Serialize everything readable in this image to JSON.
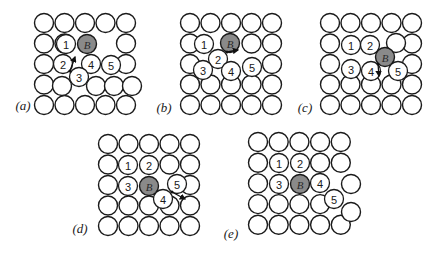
{
  "figure": {
    "colors": {
      "atom_fill": "#ffffff",
      "atom_stroke": "#1a1a1a",
      "impurity_fill": "#8a8a8a"
    },
    "radius": 9.5,
    "panels": [
      {
        "label": "(a)",
        "label_pos": [
          23,
          105
        ],
        "origin": [
          44,
          23
        ],
        "pitch": 20.5,
        "skip": [
          [
            1,
            2
          ],
          [
            1,
            3
          ],
          [
            2,
            1
          ],
          [
            2,
            2
          ],
          [
            2,
            3
          ],
          [
            3,
            1
          ],
          [
            3,
            2
          ]
        ],
        "extra_plain": [
          [
            62,
            86
          ],
          [
            96,
            86
          ],
          [
            114,
            86
          ],
          [
            132,
            86
          ]
        ],
        "special": [
          {
            "n": "1",
            "x": 66,
            "y": 44
          },
          {
            "n": "B",
            "x": 87,
            "y": 44,
            "impurity": true
          },
          {
            "n": "2",
            "x": 63,
            "y": 64
          },
          {
            "n": "4",
            "x": 91,
            "y": 64
          },
          {
            "n": "5",
            "x": 111,
            "y": 65
          },
          {
            "n": "3",
            "x": 79,
            "y": 77
          }
        ],
        "arrow": {
          "x1": 70,
          "y1": 71,
          "x2": 75,
          "y2": 57
        }
      },
      {
        "label": "(b)",
        "label_pos": [
          164,
          107
        ],
        "origin": [
          190,
          23
        ],
        "pitch": 20.5,
        "skip": [
          [
            1,
            1
          ],
          [
            1,
            2
          ],
          [
            2,
            1
          ],
          [
            2,
            2
          ],
          [
            2,
            3
          ]
        ],
        "extra_plain": [],
        "special": [
          {
            "n": "1",
            "x": 204,
            "y": 44
          },
          {
            "n": "B",
            "x": 230,
            "y": 43,
            "impurity": true
          },
          {
            "n": "2",
            "x": 218,
            "y": 59
          },
          {
            "n": "3",
            "x": 203,
            "y": 70
          },
          {
            "n": "4",
            "x": 231,
            "y": 71
          },
          {
            "n": "5",
            "x": 252,
            "y": 67
          }
        ],
        "arrow": {
          "x1": 227,
          "y1": 52,
          "x2": 238,
          "y2": 50
        }
      },
      {
        "label": "(c)",
        "label_pos": [
          305,
          107
        ],
        "origin": [
          330,
          23
        ],
        "pitch": 20.5,
        "skip": [
          [
            1,
            1
          ],
          [
            1,
            2
          ],
          [
            1,
            3
          ],
          [
            2,
            1
          ],
          [
            2,
            2
          ],
          [
            2,
            3
          ]
        ],
        "extra_plain": [
          [
            396,
            43
          ]
        ],
        "special": [
          {
            "n": "1",
            "x": 351,
            "y": 45
          },
          {
            "n": "2",
            "x": 370,
            "y": 45
          },
          {
            "n": "B",
            "x": 385,
            "y": 57,
            "impurity": true
          },
          {
            "n": "3",
            "x": 351,
            "y": 69
          },
          {
            "n": "4",
            "x": 371,
            "y": 71
          },
          {
            "n": "5",
            "x": 398,
            "y": 71
          }
        ],
        "arrow": {
          "x1": 378,
          "y1": 64,
          "x2": 379,
          "y2": 76
        }
      },
      {
        "label": "(d)",
        "label_pos": [
          80,
          228
        ],
        "origin": [
          108,
          144
        ],
        "pitch": 20.5,
        "skip": [
          [
            1,
            1
          ],
          [
            1,
            2
          ],
          [
            2,
            1
          ],
          [
            2,
            2
          ],
          [
            2,
            3
          ]
        ],
        "extra_plain": [],
        "special": [
          {
            "n": "1",
            "x": 128,
            "y": 165
          },
          {
            "n": "2",
            "x": 149,
            "y": 165
          },
          {
            "n": "3",
            "x": 128,
            "y": 186
          },
          {
            "n": "B",
            "x": 149,
            "y": 186,
            "impurity": true
          },
          {
            "n": "4",
            "x": 163,
            "y": 199
          },
          {
            "n": "5",
            "x": 177,
            "y": 184
          }
        ],
        "arrow": {
          "x1": 172,
          "y1": 192,
          "x2": 185,
          "y2": 199
        }
      },
      {
        "label": "(e)",
        "label_pos": [
          231,
          233
        ],
        "origin": [
          258,
          142
        ],
        "pitch": 20.7,
        "skip": [
          [
            1,
            1
          ],
          [
            1,
            2
          ],
          [
            2,
            1
          ],
          [
            2,
            2
          ],
          [
            2,
            3
          ],
          [
            2,
            4
          ],
          [
            3,
            4
          ]
        ],
        "extra_plain": [
          [
            351,
            184
          ],
          [
            351,
            212
          ]
        ],
        "special": [
          {
            "n": "1",
            "x": 279,
            "y": 163
          },
          {
            "n": "2",
            "x": 300,
            "y": 163
          },
          {
            "n": "3",
            "x": 279,
            "y": 184
          },
          {
            "n": "B",
            "x": 300,
            "y": 184,
            "impurity": true
          },
          {
            "n": "4",
            "x": 320,
            "y": 183
          },
          {
            "n": "5",
            "x": 334,
            "y": 199
          }
        ],
        "arrow": null
      }
    ]
  }
}
